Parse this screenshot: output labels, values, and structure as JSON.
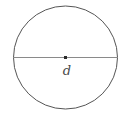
{
  "figure": {
    "kind": "geometry-diagram",
    "background_color": "#ffffff",
    "width": 125,
    "height": 115,
    "labels": {
      "diameter": "d"
    },
    "colors": {
      "circle_stroke": "#555555",
      "diameter_stroke": "#8a8a8a",
      "center_dot": "#2b2b2b",
      "label_text": "#4a4a4a"
    },
    "geometry": {
      "center_x": 65.5,
      "center_y": 57.5,
      "radius_x": 52,
      "radius_y": 51.5,
      "circle_stroke_width": 1,
      "diameter_stroke_width": 1,
      "center_dot_size": 3,
      "diameter_x1": 13.5,
      "diameter_x2": 117.5,
      "diameter_y": 57.5
    }
  }
}
